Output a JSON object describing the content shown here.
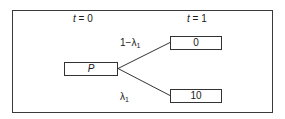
{
  "diagram": {
    "time_labels": [
      {
        "var": "t",
        "eq": " = 0"
      },
      {
        "var": "t",
        "eq": " = 1"
      }
    ],
    "nodes": {
      "root": "P",
      "up": "0",
      "down": "10"
    },
    "edges": {
      "up_prob": {
        "base": "1−λ",
        "sub": "1"
      },
      "down_prob": {
        "base": "λ",
        "sub": "1"
      }
    },
    "colors": {
      "line": "#333333",
      "frame": "#3a3a3a",
      "background": "#ffffff"
    }
  }
}
